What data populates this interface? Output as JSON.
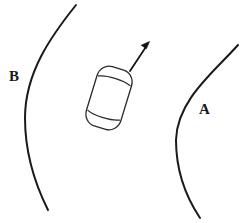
{
  "figure": {
    "background_color": "#ffffff",
    "line_color": "#1a1a1a",
    "width": 244,
    "height": 223
  },
  "labels": {
    "outer_curve": "B",
    "inner_curve": "A"
  },
  "curves": [
    {
      "name": "inner-curve-a",
      "label": "A",
      "label_side": "right-of-curve",
      "start": [
        238,
        45
      ],
      "end": [
        200,
        218
      ],
      "bulge_point": [
        176,
        136
      ],
      "bulge_direction": "left"
    },
    {
      "name": "outer-curve-b",
      "label": "B",
      "label_side": "left-of-curve",
      "start": [
        76,
        5
      ],
      "end": [
        48,
        210
      ],
      "bulge_point": [
        25,
        115
      ],
      "bulge_direction": "left"
    }
  ],
  "car": {
    "name": "car",
    "view": "top-down",
    "center": [
      109,
      98
    ],
    "body_width": 36,
    "body_length": 62,
    "rotation_degrees": 17,
    "fill": "#ffffff",
    "stroke": "#2a2a2a",
    "sections": [
      "hood",
      "cabin",
      "trunk"
    ]
  },
  "velocity_arrow": {
    "name": "velocity-arrow",
    "tail": [
      130,
      71
    ],
    "tip": [
      149,
      42
    ],
    "direction_degrees_from_horizontal": 57,
    "points": "up-and-to-the-right",
    "color": "#111111"
  }
}
